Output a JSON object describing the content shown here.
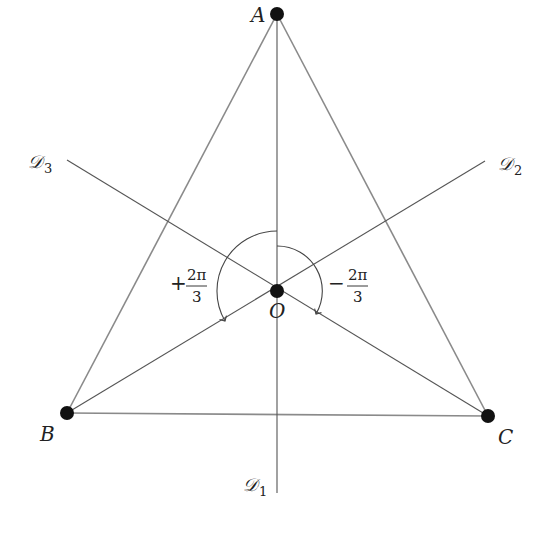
{
  "diagram": {
    "vertices": [
      {
        "id": "A",
        "label": "A"
      },
      {
        "id": "B",
        "label": "B"
      },
      {
        "id": "C",
        "label": "C"
      }
    ],
    "center": {
      "label": "O"
    },
    "axes": [
      {
        "id": "D1",
        "label": "𝒟",
        "subscript": "1",
        "through_vertex": "A"
      },
      {
        "id": "D2",
        "label": "𝒟",
        "subscript": "2",
        "through_vertex": "B"
      },
      {
        "id": "D3",
        "label": "𝒟",
        "subscript": "3",
        "through_vertex": "C"
      }
    ],
    "rotations": [
      {
        "sign": "+",
        "numerator": "2π",
        "denominator": "3",
        "direction": "counterclockwise"
      },
      {
        "sign": "−",
        "numerator": "2π",
        "denominator": "3",
        "direction": "clockwise"
      }
    ],
    "colors": {
      "edges": "#8a8a8a",
      "axes": "#555555",
      "vertex_dots": "#111111"
    }
  }
}
